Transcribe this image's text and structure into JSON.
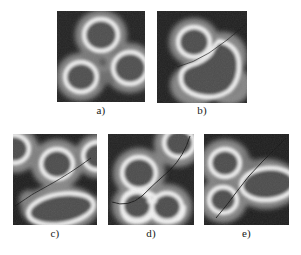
{
  "figure": {
    "type": "micrograph-panel-series",
    "background": "#ffffff",
    "panel_count": 5,
    "colors": {
      "panel_background": "#1d1d1d",
      "ring_bright": "#f2f2f2",
      "halo_gray": "#8e8e8e",
      "core_gray": "#4a4a4a",
      "curve_dark": "#151515",
      "caption_text": "#1a1a1a"
    },
    "panels": [
      {
        "id": "a",
        "caption": "a)",
        "description": "Three bright annular rings on dark background with gray halos",
        "ring_count": 3,
        "has_curve": false,
        "merged": false,
        "shapes": [
          {
            "kind": "ring",
            "cx": 44,
            "cy": 24,
            "rx": 17,
            "ry": 16
          },
          {
            "kind": "ring",
            "cx": 24,
            "cy": 66,
            "rx": 16,
            "ry": 15
          },
          {
            "kind": "ring",
            "cx": 73,
            "cy": 57,
            "rx": 17,
            "ry": 16
          }
        ]
      },
      {
        "id": "b",
        "caption": "b)",
        "description": "One ring top-left and a large merged bilobed loop at lower-right",
        "ring_count": 2,
        "has_curve": true,
        "merged": true,
        "shapes": [
          {
            "kind": "ring",
            "cx": 37,
            "cy": 31,
            "rx": 16,
            "ry": 15
          },
          {
            "kind": "merged-loop",
            "cx": 56,
            "cy": 60,
            "rx": 31,
            "ry": 28
          }
        ]
      },
      {
        "id": "c",
        "caption": "c)",
        "description": "Central ring, elongated lower-right lobe, partial shapes at edges",
        "ring_count": 2,
        "has_curve": true,
        "merged": false,
        "shapes": [
          {
            "kind": "ring",
            "cx": 44,
            "cy": 30,
            "rx": 16,
            "ry": 15
          },
          {
            "kind": "ellipse-ring",
            "cx": 47,
            "cy": 74,
            "rx": 31,
            "ry": 16
          }
        ]
      },
      {
        "id": "d",
        "caption": "d)",
        "description": "Corner ring top-right, ring center-left, two merged rings bottom",
        "ring_count": 4,
        "has_curve": true,
        "merged": true,
        "shapes": [
          {
            "kind": "ring",
            "cx": 70,
            "cy": 10,
            "rx": 15,
            "ry": 14
          },
          {
            "kind": "ring",
            "cx": 31,
            "cy": 39,
            "rx": 17,
            "ry": 16
          },
          {
            "kind": "ring",
            "cx": 29,
            "cy": 72,
            "rx": 15,
            "ry": 14
          },
          {
            "kind": "ring",
            "cx": 59,
            "cy": 73,
            "rx": 15,
            "ry": 14
          }
        ]
      },
      {
        "id": "e",
        "caption": "e)",
        "description": "Two stacked rings at left joined by halo, large horizontal elliptical ring at right",
        "ring_count": 3,
        "has_curve": true,
        "merged": true,
        "shapes": [
          {
            "kind": "ring",
            "cx": 21,
            "cy": 29,
            "rx": 15,
            "ry": 14
          },
          {
            "kind": "ring",
            "cx": 19,
            "cy": 66,
            "rx": 14,
            "ry": 13
          },
          {
            "kind": "ellipse-ring",
            "cx": 62,
            "cy": 50,
            "rx": 27,
            "ry": 16
          }
        ]
      }
    ]
  }
}
